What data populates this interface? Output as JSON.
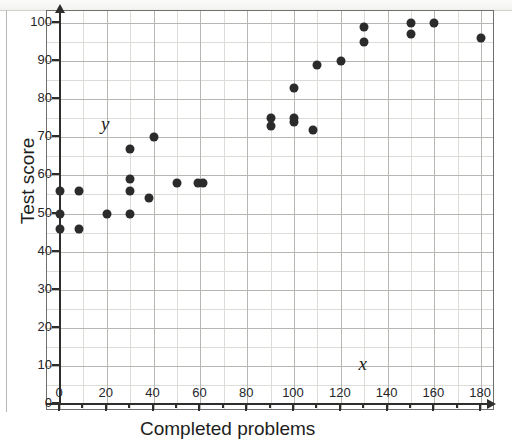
{
  "figure": {
    "axis_title_x": "Completed problems",
    "axis_title_y": "Test score",
    "var_label_x": "x",
    "var_label_y": "y",
    "dot_color": "#2b2b2b",
    "grid_color": "#b6b6b2",
    "axis_color": "#2e2e2c"
  },
  "chart_data": {
    "type": "scatter",
    "title": "",
    "xlabel": "Completed problems",
    "ylabel": "Test score",
    "xlim": [
      0,
      185
    ],
    "ylim": [
      0,
      100
    ],
    "xticks": [
      0,
      20,
      40,
      60,
      80,
      100,
      120,
      140,
      160,
      180
    ],
    "yticks": [
      0,
      10,
      20,
      30,
      40,
      50,
      60,
      70,
      80,
      90,
      100
    ],
    "xtick_labels": [
      "0",
      "20",
      "40",
      "60",
      "80",
      "100",
      "120",
      "140",
      "160",
      "180"
    ],
    "ytick_labels": [
      "0",
      "10",
      "20",
      "30",
      "40",
      "50",
      "60",
      "70",
      "80",
      "90",
      "100"
    ],
    "grid": true,
    "minor_grid": true,
    "minor_step_x": 10,
    "minor_step_y": 5,
    "legend": "none",
    "annotations": [
      {
        "text": "y",
        "x": 18,
        "y": 73
      },
      {
        "text": "x",
        "x": 128,
        "y": 10
      }
    ],
    "points": [
      {
        "x": 0,
        "y": 46
      },
      {
        "x": 0,
        "y": 50
      },
      {
        "x": 0,
        "y": 56
      },
      {
        "x": 8,
        "y": 46
      },
      {
        "x": 8,
        "y": 56
      },
      {
        "x": 20,
        "y": 50
      },
      {
        "x": 30,
        "y": 50
      },
      {
        "x": 30,
        "y": 56
      },
      {
        "x": 30,
        "y": 59
      },
      {
        "x": 30,
        "y": 67
      },
      {
        "x": 38,
        "y": 54
      },
      {
        "x": 40,
        "y": 70
      },
      {
        "x": 50,
        "y": 58
      },
      {
        "x": 59,
        "y": 58
      },
      {
        "x": 61,
        "y": 58
      },
      {
        "x": 90,
        "y": 73
      },
      {
        "x": 90,
        "y": 75
      },
      {
        "x": 100,
        "y": 74
      },
      {
        "x": 100,
        "y": 75
      },
      {
        "x": 100,
        "y": 83
      },
      {
        "x": 108,
        "y": 72
      },
      {
        "x": 110,
        "y": 89
      },
      {
        "x": 120,
        "y": 90
      },
      {
        "x": 130,
        "y": 95
      },
      {
        "x": 130,
        "y": 99
      },
      {
        "x": 150,
        "y": 97
      },
      {
        "x": 150,
        "y": 100
      },
      {
        "x": 160,
        "y": 100
      },
      {
        "x": 180,
        "y": 96
      }
    ]
  }
}
